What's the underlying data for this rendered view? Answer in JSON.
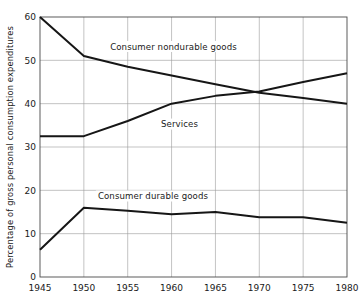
{
  "chart_data": {
    "type": "line",
    "title": "",
    "xlabel": "",
    "ylabel": "Percentage of gross personal consumption expenditures",
    "xlim": [
      1945,
      1980
    ],
    "ylim": [
      0,
      60
    ],
    "x_ticks": [
      1945,
      1950,
      1955,
      1960,
      1965,
      1970,
      1975,
      1980
    ],
    "y_ticks": [
      0,
      10,
      20,
      30,
      40,
      50,
      60
    ],
    "grid": true,
    "legend_position": "inline-labels",
    "x": [
      1945,
      1950,
      1955,
      1960,
      1965,
      1970,
      1975,
      1980
    ],
    "series": [
      {
        "name": "Consumer nondurable goods",
        "values": [
          60.0,
          51.0,
          48.5,
          46.5,
          44.5,
          42.5,
          41.3,
          40.0
        ],
        "label_x": 1953.0,
        "label_y": 52.5
      },
      {
        "name": "Services",
        "values": [
          32.5,
          32.5,
          36.0,
          40.0,
          41.8,
          42.8,
          45.0,
          47.0
        ],
        "label_x": 1958.8,
        "label_y": 34.6
      },
      {
        "name": "Consumer durable goods",
        "values": [
          6.3,
          16.0,
          15.3,
          14.5,
          15.0,
          13.8,
          13.8,
          12.5
        ],
        "label_x": 1951.6,
        "label_y": 18.0
      }
    ]
  },
  "axes": {
    "y_axis_title": "Percentage of gross personal consumption expenditures",
    "x_tick_labels": [
      "1945",
      "1950",
      "1955",
      "1960",
      "1965",
      "1970",
      "1975",
      "1980"
    ],
    "y_tick_labels": [
      "0",
      "10",
      "20",
      "30",
      "40",
      "50",
      "60"
    ]
  }
}
